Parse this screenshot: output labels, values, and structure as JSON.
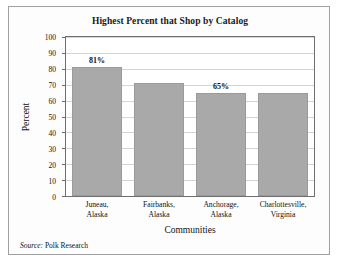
{
  "chart_data": {
    "type": "bar",
    "title": "Highest Percent that Shop by Catalog",
    "xlabel": "Communities",
    "ylabel": "Percent",
    "ylim": [
      0,
      100
    ],
    "ytick_step": 10,
    "grid": true,
    "legend": false,
    "categories": [
      "Juneau,\nAlaska",
      "Fairbanks,\nAlaska",
      "Anchorage,\nAlaska",
      "Charlottesville,\nVirginia"
    ],
    "category_lines": [
      [
        "Juneau,",
        "Alaska"
      ],
      [
        "Fairbanks,",
        "Alaska"
      ],
      [
        "Anchorage,",
        "Alaska"
      ],
      [
        "Charlottesville,",
        "Virginia"
      ]
    ],
    "values": [
      81,
      71,
      65,
      65
    ],
    "data_labels": [
      "81%",
      "",
      "65%",
      ""
    ],
    "ytick_labels": [
      "100",
      "90",
      "80",
      "70",
      "60",
      "50",
      "40",
      "30",
      "20",
      "10",
      "0"
    ],
    "bar_color": "#a9a9a9",
    "grid_color": "#d5d5d5",
    "axis_color": "#6f6f6f"
  },
  "source": {
    "label": "Source:",
    "value": " Polk Research"
  }
}
